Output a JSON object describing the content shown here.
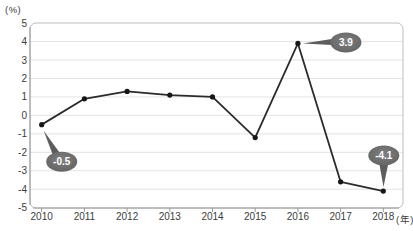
{
  "chart_data": {
    "type": "line",
    "title": "",
    "categories": [
      "2010",
      "2011",
      "2012",
      "2013",
      "2014",
      "2015",
      "2016",
      "2017",
      "2018"
    ],
    "values": [
      -0.5,
      0.9,
      1.3,
      1.1,
      1.0,
      -1.2,
      3.9,
      -3.6,
      -4.1
    ],
    "yticks": [
      5,
      4,
      3,
      2,
      1,
      0,
      -1,
      -2,
      -3,
      -4,
      -5
    ],
    "ylim": [
      -5,
      5
    ],
    "ylabel_unit": "(%)",
    "xlabel_unit": "(年)",
    "grid": true,
    "legend": "none",
    "annotations": [
      {
        "category": "2010",
        "index": 0,
        "text": "-0.5",
        "placement": "below-right"
      },
      {
        "category": "2016",
        "index": 6,
        "text": "3.9",
        "placement": "right"
      },
      {
        "category": "2018",
        "index": 8,
        "text": "-4.1",
        "placement": "above"
      }
    ],
    "colors": {
      "line": "#2b2b2b",
      "marker": "#161616",
      "grid": "#e3e3e3",
      "frame": "#bcbcbc",
      "axis": "#9a9a9a",
      "tick_label": "#3c3c3c",
      "bubble_fill_light": "#808080",
      "bubble_fill_dark": "#5d5d5d",
      "bubble_text": "#ffffff"
    }
  }
}
